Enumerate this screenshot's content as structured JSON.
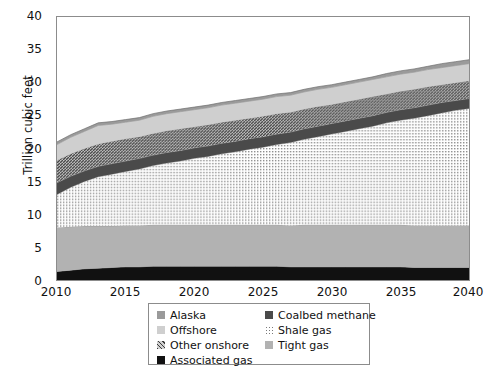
{
  "chart_data": {
    "type": "area",
    "stacked": true,
    "title": "",
    "xlabel": "",
    "ylabel": "Trillion cubic feet",
    "xlim": [
      2010,
      2040
    ],
    "ylim": [
      0,
      40
    ],
    "xticks": [
      2010,
      2015,
      2020,
      2025,
      2030,
      2035,
      2040
    ],
    "yticks": [
      0,
      5,
      10,
      15,
      20,
      25,
      30,
      35,
      40
    ],
    "grid": false,
    "legend_position": "below-plot",
    "x": [
      2010,
      2011,
      2012,
      2013,
      2014,
      2015,
      2016,
      2017,
      2018,
      2019,
      2020,
      2021,
      2022,
      2023,
      2024,
      2025,
      2026,
      2027,
      2028,
      2029,
      2030,
      2031,
      2032,
      2033,
      2034,
      2035,
      2036,
      2037,
      2038,
      2039,
      2040
    ],
    "series": [
      {
        "name": "Associated gas",
        "fill": "#111111",
        "pattern": "solid",
        "values": [
          1.3,
          1.5,
          1.7,
          1.8,
          1.9,
          2.0,
          2.0,
          2.1,
          2.1,
          2.1,
          2.1,
          2.1,
          2.1,
          2.1,
          2.1,
          2.1,
          2.1,
          2.0,
          2.0,
          2.0,
          2.0,
          2.0,
          2.0,
          2.0,
          2.0,
          2.0,
          1.9,
          1.9,
          1.9,
          1.9,
          1.9
        ]
      },
      {
        "name": "Tight gas",
        "fill": "#b2b2b2",
        "pattern": "solid",
        "values": [
          6.7,
          6.6,
          6.5,
          6.4,
          6.3,
          6.3,
          6.3,
          6.3,
          6.3,
          6.3,
          6.3,
          6.3,
          6.3,
          6.3,
          6.3,
          6.3,
          6.3,
          6.3,
          6.4,
          6.4,
          6.4,
          6.4,
          6.4,
          6.4,
          6.4,
          6.4,
          6.4,
          6.4,
          6.4,
          6.4,
          6.4
        ]
      },
      {
        "name": "Shale gas",
        "fill": "#e0e0e0",
        "pattern": "fine-dots",
        "values": [
          5.0,
          6.0,
          6.8,
          7.5,
          7.9,
          8.2,
          8.6,
          9.0,
          9.4,
          9.7,
          10.1,
          10.4,
          10.8,
          11.1,
          11.5,
          11.8,
          12.2,
          12.6,
          13.0,
          13.4,
          13.8,
          14.2,
          14.6,
          15.0,
          15.5,
          15.9,
          16.3,
          16.7,
          17.1,
          17.5,
          17.8
        ]
      },
      {
        "name": "Coalbed methane",
        "fill": "#4a4a4a",
        "pattern": "solid",
        "values": [
          1.8,
          1.7,
          1.6,
          1.6,
          1.6,
          1.6,
          1.6,
          1.6,
          1.6,
          1.6,
          1.6,
          1.6,
          1.6,
          1.6,
          1.6,
          1.6,
          1.6,
          1.6,
          1.6,
          1.6,
          1.6,
          1.6,
          1.6,
          1.6,
          1.6,
          1.6,
          1.6,
          1.6,
          1.6,
          1.5,
          1.5
        ]
      },
      {
        "name": "Other onshore",
        "fill": "#8f8f8f",
        "pattern": "diagonal-hatch",
        "values": [
          3.4,
          3.4,
          3.4,
          3.4,
          3.4,
          3.4,
          3.3,
          3.3,
          3.3,
          3.3,
          3.2,
          3.2,
          3.2,
          3.2,
          3.1,
          3.1,
          3.1,
          3.0,
          3.0,
          3.0,
          2.9,
          2.9,
          2.9,
          2.9,
          2.8,
          2.8,
          2.8,
          2.8,
          2.7,
          2.7,
          2.7
        ]
      },
      {
        "name": "Offshore",
        "fill": "#cfcfcf",
        "pattern": "solid",
        "values": [
          2.4,
          2.5,
          2.6,
          2.8,
          2.6,
          2.5,
          2.5,
          2.6,
          2.6,
          2.6,
          2.6,
          2.6,
          2.6,
          2.6,
          2.6,
          2.6,
          2.6,
          2.6,
          2.6,
          2.6,
          2.6,
          2.6,
          2.6,
          2.6,
          2.6,
          2.6,
          2.6,
          2.6,
          2.6,
          2.6,
          2.6
        ]
      },
      {
        "name": "Alaska",
        "fill": "#9a9a9a",
        "pattern": "solid",
        "values": [
          0.4,
          0.4,
          0.4,
          0.4,
          0.4,
          0.4,
          0.4,
          0.4,
          0.4,
          0.4,
          0.4,
          0.4,
          0.4,
          0.4,
          0.4,
          0.4,
          0.4,
          0.4,
          0.4,
          0.4,
          0.4,
          0.4,
          0.4,
          0.4,
          0.5,
          0.5,
          0.5,
          0.5,
          0.6,
          0.6,
          0.6
        ]
      }
    ],
    "totals": [
      21.0,
      22.1,
      23.0,
      23.9,
      24.1,
      24.4,
      24.7,
      25.3,
      25.7,
      26.0,
      26.3,
      26.6,
      27.0,
      27.3,
      27.6,
      27.9,
      28.3,
      28.5,
      29.0,
      29.4,
      29.7,
      30.1,
      30.5,
      30.9,
      31.4,
      31.8,
      32.1,
      32.5,
      32.9,
      33.2,
      33.5
    ]
  },
  "axes": {
    "ylabel": "Trillion cubic feet",
    "yticks": [
      "40",
      "35",
      "30",
      "25",
      "20",
      "15",
      "10",
      "5",
      "0"
    ],
    "xticks": [
      "2010",
      "2015",
      "2020",
      "2025",
      "2030",
      "2035",
      "2040"
    ]
  },
  "legend": {
    "left_column": [
      {
        "label": "Alaska",
        "swatch": "alaska-swatch"
      },
      {
        "label": "Offshore",
        "swatch": "offshore-swatch"
      },
      {
        "label": "Other onshore",
        "swatch": "other-onshore-swatch"
      },
      {
        "label": "Associated gas",
        "swatch": "associated-gas-swatch"
      }
    ],
    "right_column": [
      {
        "label": "Coalbed methane",
        "swatch": "coalbed-methane-swatch"
      },
      {
        "label": "Shale gas",
        "swatch": "shale-gas-swatch"
      },
      {
        "label": "Tight gas",
        "swatch": "tight-gas-swatch"
      }
    ]
  },
  "colors": {
    "alaska": "#9a9a9a",
    "offshore": "#cfcfcf",
    "other_onshore": "#8f8f8f",
    "associated_gas": "#111111",
    "coalbed_methane": "#4a4a4a",
    "shale_gas": "#e0e0e0",
    "tight_gas": "#b2b2b2",
    "frame": "#8c8c8c",
    "text": "#111111"
  }
}
